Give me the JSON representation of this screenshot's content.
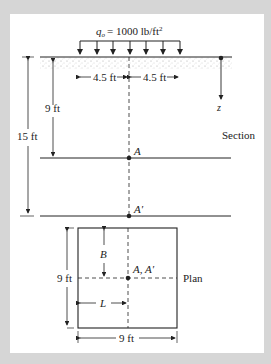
{
  "diagram": {
    "load": {
      "label_symbol": "q",
      "label_sub": "o",
      "label_value": "= 1000 lb/ft",
      "label_sup": "2",
      "arrow_count": 7
    },
    "section": {
      "title": "Section",
      "half_width_left": "4.5 ft",
      "half_width_right": "4.5 ft",
      "depth_A": "9 ft",
      "depth_A_prime": "15 ft",
      "point_A": "A",
      "point_A_prime": "A′",
      "axis_label": "z"
    },
    "plan": {
      "title": "Plan",
      "side_vertical": "9 ft",
      "side_horizontal": "9 ft",
      "dim_B": "B",
      "dim_L": "L",
      "center_label": "A, A′"
    }
  },
  "colors": {
    "frame": "#d6d6d6",
    "panel": "#ffffff",
    "ink": "#222222",
    "soil": "#bdbdbd"
  }
}
